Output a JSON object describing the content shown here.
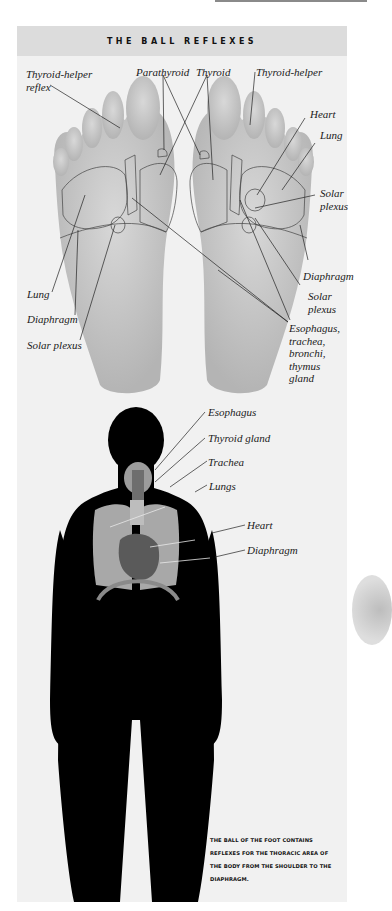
{
  "title": "THE BALL REFLEXES",
  "feet_labels": {
    "thyroid_helper_reflex": [
      "Thyroid-helper",
      "reflex"
    ],
    "parathyroid": "Parathyroid",
    "thyroid": "Thyroid",
    "thyroid_helper": "Thyroid-helper",
    "heart": "Heart",
    "lung_right": "Lung",
    "solar_plexus_right": [
      "Solar",
      "plexus"
    ],
    "diaphragm_right": "Diaphragm",
    "solar_plexus_right2": [
      "Solar",
      "plexus"
    ],
    "esophagus_group": [
      "Esophagus,",
      "trachea,",
      "bronchi,",
      "thymus",
      "gland"
    ],
    "lung_left": "Lung",
    "diaphragm_left": "Diaphragm",
    "solar_plexus_left": "Solar plexus"
  },
  "body_labels": {
    "esophagus": "Esophagus",
    "thyroid_gland": "Thyroid gland",
    "trachea": "Trachea",
    "lungs": "Lungs",
    "heart": "Heart",
    "diaphragm": "Diaphragm"
  },
  "caption": [
    "THE BALL OF THE FOOT CONTAINS",
    "REFLEXES FOR THE THORACIC AREA OF",
    "THE BODY FROM THE SHOULDER TO THE",
    "DIAPHRAGM."
  ],
  "colors": {
    "panel": "#f1f1f1",
    "header": "#dcdcdc",
    "foot": "#c4c4c4",
    "silhouette": "#000000",
    "lungs": "#a8a8a8",
    "heart": "#5a5a5a"
  }
}
